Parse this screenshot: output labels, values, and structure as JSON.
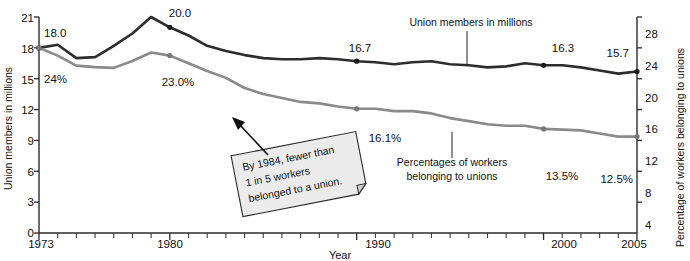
{
  "chart_data": {
    "type": "line",
    "title": "",
    "xlabel": "Year",
    "ylabel": "Union members in millions",
    "y2label": "Percentage of workers belonging to unions",
    "grid": false,
    "legend_position": "inline-annotation",
    "xlim": [
      1973,
      2005
    ],
    "xticks": [
      1973,
      1980,
      1990,
      2000,
      2005
    ],
    "xtick_labels": [
      "1973",
      "1980",
      "1990",
      "2000",
      "2005"
    ],
    "xtick_minor_step": 1,
    "ylim": [
      0,
      21
    ],
    "yticks": [
      0,
      3,
      6,
      9,
      12,
      15,
      18,
      21
    ],
    "ytick_labels": [
      "0",
      "3",
      "6",
      "9",
      "12",
      "15",
      "18",
      "21"
    ],
    "y2lim": [
      0,
      28
    ],
    "y2ticks": [
      4,
      8,
      12,
      16,
      20,
      24,
      28
    ],
    "y2tick_labels": [
      "4",
      "8",
      "12",
      "16",
      "20",
      "24",
      "28"
    ],
    "x": [
      1973,
      1974,
      1975,
      1976,
      1977,
      1978,
      1979,
      1980,
      1981,
      1982,
      1983,
      1984,
      1985,
      1986,
      1987,
      1988,
      1989,
      1990,
      1991,
      1992,
      1993,
      1994,
      1995,
      1996,
      1997,
      1998,
      1999,
      2000,
      2001,
      2002,
      2003,
      2004,
      2005
    ],
    "series": [
      {
        "name": "Union members in millions",
        "axis": "left",
        "color": "#2d2d2d",
        "label_text": "Union members in millions",
        "values": [
          18.0,
          18.3,
          17.0,
          17.1,
          18.2,
          19.4,
          21.0,
          20.0,
          19.2,
          18.2,
          17.7,
          17.3,
          17.0,
          16.9,
          16.9,
          17.0,
          16.9,
          16.7,
          16.6,
          16.4,
          16.6,
          16.7,
          16.4,
          16.3,
          16.1,
          16.2,
          16.5,
          16.3,
          16.3,
          16.1,
          15.8,
          15.5,
          15.7
        ]
      },
      {
        "name": "Percentages of workers belonging to unions",
        "axis": "right",
        "color": "#8a8a8a",
        "label_text": "Percentages of workers belonging to unions",
        "values": [
          24.0,
          23.0,
          21.7,
          21.5,
          21.4,
          22.3,
          23.4,
          23.0,
          22.0,
          21.0,
          20.1,
          18.8,
          18.0,
          17.5,
          17.0,
          16.8,
          16.4,
          16.1,
          16.1,
          15.8,
          15.8,
          15.5,
          14.9,
          14.5,
          14.1,
          13.9,
          13.9,
          13.5,
          13.4,
          13.3,
          12.9,
          12.5,
          12.5
        ]
      }
    ],
    "point_labels": [
      {
        "series": "Union members in millions",
        "x": 1973,
        "value": 18.0,
        "text": "18.0"
      },
      {
        "series": "Union members in millions",
        "x": 1980,
        "value": 20.0,
        "text": "20.0"
      },
      {
        "series": "Union members in millions",
        "x": 1990,
        "value": 16.7,
        "text": "16.7"
      },
      {
        "series": "Union members in millions",
        "x": 2000,
        "value": 16.3,
        "text": "16.3"
      },
      {
        "series": "Union members in millions",
        "x": 2005,
        "value": 15.7,
        "text": "15.7"
      },
      {
        "series": "Percentages of workers belonging to unions",
        "x": 1973,
        "value": 24.0,
        "text": "24%"
      },
      {
        "series": "Percentages of workers belonging to unions",
        "x": 1980,
        "value": 23.0,
        "text": "23.0%"
      },
      {
        "series": "Percentages of workers belonging to unions",
        "x": 1990,
        "value": 16.1,
        "text": "16.1%"
      },
      {
        "series": "Percentages of workers belonging to unions",
        "x": 2000,
        "value": 13.5,
        "text": "13.5%"
      },
      {
        "series": "Percentages of workers belonging to unions",
        "x": 2005,
        "value": 12.5,
        "text": "12.5%"
      }
    ],
    "annotation": {
      "lines": [
        "By 1984, fewer than",
        "1 in 5 workers",
        "belonged to a union."
      ],
      "points_to_year": 1984,
      "points_to_series": "Percentages of workers belonging to unions"
    }
  },
  "labels": {
    "y_axis_title": "Union members in millions",
    "y2_axis_title": "Percentage of workers belonging to unions",
    "x_axis_title": "Year",
    "dark_series_label": "Union members in millions",
    "gray_series_label_line1": "Percentages of workers",
    "gray_series_label_line2": "belonging to unions",
    "callout_line1": "By 1984, fewer than",
    "callout_line2": "1 in 5 workers",
    "callout_line3": "belonged to a union.",
    "tick_y_21": "21",
    "tick_y_18": "18",
    "tick_y_15": "15",
    "tick_y_12": "12",
    "tick_y_9": "9",
    "tick_y_6": "6",
    "tick_y_3": "3",
    "tick_y_0": "0",
    "tick_y2_28": "28",
    "tick_y2_24": "24",
    "tick_y2_20": "20",
    "tick_y2_16": "16",
    "tick_y2_12": "12",
    "tick_y2_8": "8",
    "tick_y2_4": "4",
    "tick_x_1973": "1973",
    "tick_x_1980": "1980",
    "tick_x_1990": "1990",
    "tick_x_2000": "2000",
    "tick_x_2005": "2005",
    "lbl_18_0": "18.0",
    "lbl_20_0": "20.0",
    "lbl_16_7": "16.7",
    "lbl_16_3": "16.3",
    "lbl_15_7": "15.7",
    "lbl_24pct": "24%",
    "lbl_23pct": "23.0%",
    "lbl_16_1pct": "16.1%",
    "lbl_13_5pct": "13.5%",
    "lbl_12_5pct": "12.5%"
  },
  "colors": {
    "dark_series": "#2d2d2d",
    "gray_series": "#8a8a8a",
    "axis": "#2b2b2b",
    "callout_fill": "#ebebeb",
    "background": "#ffffff"
  }
}
